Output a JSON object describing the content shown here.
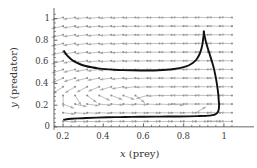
{
  "figure": {
    "name": "phase-portrait-predator-prey",
    "background": "#ffffff",
    "width": 257,
    "height": 168
  },
  "axes": {
    "x": {
      "title_var": "x",
      "title_rest": "(prey)",
      "ticks": [
        "0.2",
        "0.4",
        "0.6",
        "0.8",
        "1"
      ],
      "tick_values": [
        0.2,
        0.4,
        0.6,
        0.8,
        1.0
      ],
      "minor_count": 4,
      "range": [
        0.155,
        1.075
      ]
    },
    "y": {
      "title_var": "y",
      "title_rest": "(predator)",
      "ticks": [
        "0",
        "0.2",
        "0.4",
        "0.6",
        "0.8",
        "1"
      ],
      "tick_values": [
        0,
        0.2,
        0.4,
        0.6,
        0.8,
        1.0
      ],
      "minor_count": 4,
      "range": [
        -0.02,
        1.07
      ]
    },
    "axis_color": "#555555"
  },
  "chart_data": {
    "type": "line",
    "title": "",
    "xlabel": "x (prey)",
    "ylabel": "y (predator)",
    "xlim": [
      0.155,
      1.075
    ],
    "ylim": [
      -0.02,
      1.07
    ],
    "grid": false,
    "legend": "none",
    "series": [
      {
        "name": "trajectory-upper",
        "color": "#111111",
        "width": 1.9,
        "points": [
          [
            0.205,
            0.7
          ],
          [
            0.215,
            0.672
          ],
          [
            0.228,
            0.645
          ],
          [
            0.243,
            0.62
          ],
          [
            0.262,
            0.597
          ],
          [
            0.285,
            0.578
          ],
          [
            0.312,
            0.562
          ],
          [
            0.342,
            0.55
          ],
          [
            0.375,
            0.54
          ],
          [
            0.412,
            0.533
          ],
          [
            0.452,
            0.528
          ],
          [
            0.495,
            0.524
          ],
          [
            0.54,
            0.522
          ],
          [
            0.585,
            0.521
          ],
          [
            0.63,
            0.521
          ],
          [
            0.675,
            0.523
          ],
          [
            0.715,
            0.527
          ],
          [
            0.752,
            0.534
          ],
          [
            0.785,
            0.544
          ],
          [
            0.812,
            0.558
          ],
          [
            0.835,
            0.578
          ],
          [
            0.853,
            0.602
          ],
          [
            0.867,
            0.632
          ],
          [
            0.878,
            0.668
          ],
          [
            0.886,
            0.708
          ],
          [
            0.892,
            0.752
          ],
          [
            0.896,
            0.8
          ],
          [
            0.899,
            0.845
          ],
          [
            0.9,
            0.88
          ]
        ]
      },
      {
        "name": "trajectory-right-descent",
        "color": "#111111",
        "width": 1.9,
        "points": [
          [
            0.9,
            0.88
          ],
          [
            0.905,
            0.83
          ],
          [
            0.912,
            0.775
          ],
          [
            0.921,
            0.718
          ],
          [
            0.931,
            0.66
          ],
          [
            0.941,
            0.6
          ],
          [
            0.95,
            0.54
          ],
          [
            0.957,
            0.48
          ],
          [
            0.963,
            0.42
          ],
          [
            0.968,
            0.36
          ],
          [
            0.972,
            0.3
          ],
          [
            0.974,
            0.25
          ],
          [
            0.976,
            0.205
          ],
          [
            0.975,
            0.17
          ],
          [
            0.972,
            0.145
          ],
          [
            0.966,
            0.127
          ],
          [
            0.957,
            0.115
          ],
          [
            0.944,
            0.108
          ],
          [
            0.928,
            0.104
          ],
          [
            0.905,
            0.101
          ]
        ]
      },
      {
        "name": "trajectory-lower-approach",
        "color": "#111111",
        "width": 1.9,
        "points": [
          [
            0.905,
            0.101
          ],
          [
            0.87,
            0.099
          ],
          [
            0.825,
            0.097
          ],
          [
            0.775,
            0.096
          ],
          [
            0.72,
            0.095
          ],
          [
            0.66,
            0.094
          ],
          [
            0.6,
            0.093
          ],
          [
            0.54,
            0.092
          ],
          [
            0.48,
            0.09
          ],
          [
            0.42,
            0.088
          ],
          [
            0.365,
            0.085
          ],
          [
            0.315,
            0.082
          ],
          [
            0.272,
            0.078
          ],
          [
            0.24,
            0.074
          ],
          [
            0.218,
            0.07
          ],
          [
            0.205,
            0.066
          ]
        ]
      }
    ],
    "vector_field": {
      "name": "direction-field",
      "color": "#a8a8a8",
      "dot_color": "#8f8f8f",
      "description": "Normalized arrows of a Lotka-Volterra style predator-prey system; arrows point right at low y, down-right at high y, and leftward near the right boundary at high y.",
      "x_samples": [
        0.2,
        0.26,
        0.32,
        0.38,
        0.44,
        0.5,
        0.56,
        0.62,
        0.68,
        0.74,
        0.8,
        0.86,
        0.92,
        0.98,
        1.04
      ],
      "y_samples": [
        0.05,
        0.13,
        0.21,
        0.29,
        0.37,
        0.45,
        0.53,
        0.61,
        0.69,
        0.77,
        0.85,
        0.93,
        1.01
      ]
    }
  }
}
